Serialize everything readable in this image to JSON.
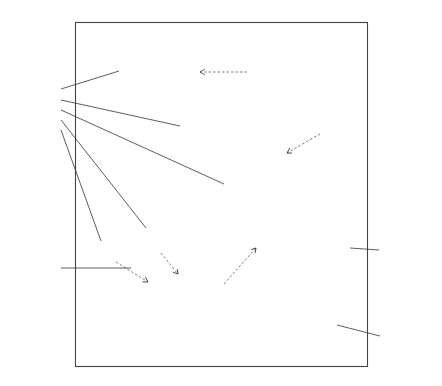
{
  "diagram": {
    "type": "uml-use-case",
    "system": {
      "label": "system"
    },
    "actors": [
      {
        "id": "global_manager",
        "label": "Global Manager"
      },
      {
        "id": "solution_manager",
        "label": "Solution Manager"
      },
      {
        "id": "optimizing_agent",
        "label": "Optimizing Agent"
      },
      {
        "id": "attribute_manager",
        "label": "Attribute Manager"
      }
    ],
    "use_cases": [
      {
        "id": "uc_global_classifier",
        "label": "create the global classifier"
      },
      {
        "id": "uc_global_prototypes",
        "label": "create the gloal set of prototypes"
      },
      {
        "id": "uc_identify_tasks",
        "label": "identify the distributed learning tasks"
      },
      {
        "id": "uc_move_agents",
        "label": "move agents"
      },
      {
        "id": "uc_data_reduction",
        "label": "manage the data reduction subproblems"
      },
      {
        "id": "uc_create_agents",
        "label": "create agents"
      },
      {
        "id": "uc_delete_agents",
        "label": "delete agents"
      },
      {
        "id": "uc_population",
        "label": "manage the population of solutions"
      },
      {
        "id": "uc_attr_instance",
        "label": "attribute and instance selection"
      },
      {
        "id": "uc_attr_coord",
        "label": "attribute selection coordination"
      }
    ],
    "relations": [
      {
        "type": "extend",
        "label": "<<extend>>",
        "from": "create the gloal set of prototypes",
        "to": "create the global classifier"
      },
      {
        "type": "extend",
        "label": "<<extend>>",
        "from": "move agents",
        "to": "manage the data reduction subproblems"
      },
      {
        "type": "extend",
        "label": "<<extend>>",
        "from": "create agents",
        "to": "manage the population of solutions"
      },
      {
        "type": "extend",
        "label": "<<extend>>",
        "from": "delete agents",
        "to": "manage the population of solutions"
      },
      {
        "type": "include",
        "label": "<<include>>",
        "from": "manage the population of solutions",
        "to": "attribute and instance selection"
      },
      {
        "type": "include",
        "label": "<<include>>",
        "from": "manage the population of solutions",
        "to": "attribute selection coordination"
      }
    ],
    "associations": [
      {
        "actor": "Global Manager",
        "use_case": "create the global classifier"
      },
      {
        "actor": "Global Manager",
        "use_case": "identify the distributed learning tasks"
      },
      {
        "actor": "Global Manager",
        "use_case": "manage the data reduction subproblems"
      },
      {
        "actor": "Global Manager",
        "use_case": "delete agents"
      },
      {
        "actor": "Global Manager",
        "use_case": "create agents"
      },
      {
        "actor": "Solution Manager",
        "use_case": "manage the population of solutions"
      },
      {
        "actor": "Optimizing Agent",
        "use_case": "attribute and instance selection"
      },
      {
        "actor": "Attribute Manager",
        "use_case": "attribute selection coordination"
      }
    ]
  }
}
